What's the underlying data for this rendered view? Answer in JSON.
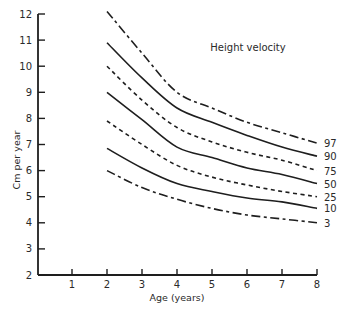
{
  "chart_data": {
    "type": "line",
    "title": "Height velocity",
    "xlabel": "Age (years)",
    "ylabel": "Cm per year",
    "xlim": [
      0,
      8
    ],
    "ylim": [
      2,
      12
    ],
    "x_ticks": [
      1,
      2,
      3,
      4,
      5,
      6,
      7,
      8
    ],
    "y_ticks": [
      2,
      3,
      4,
      5,
      6,
      7,
      8,
      9,
      10,
      11,
      12
    ],
    "grid": false,
    "legend_position": "inline-right",
    "x": [
      2,
      3,
      4,
      5,
      6,
      7,
      8
    ],
    "series": [
      {
        "name": "97",
        "style": "dash-dot",
        "values": [
          12.1,
          10.5,
          9.0,
          8.4,
          7.85,
          7.45,
          7.05
        ]
      },
      {
        "name": "90",
        "style": "solid",
        "values": [
          10.9,
          9.55,
          8.4,
          7.85,
          7.35,
          6.9,
          6.55
        ]
      },
      {
        "name": "75",
        "style": "dashed",
        "values": [
          10.0,
          8.7,
          7.65,
          7.1,
          6.7,
          6.4,
          6.0
        ]
      },
      {
        "name": "50",
        "style": "solid",
        "values": [
          9.0,
          7.95,
          6.9,
          6.5,
          6.1,
          5.85,
          5.5
        ]
      },
      {
        "name": "25",
        "style": "dashed",
        "values": [
          7.9,
          7.0,
          6.2,
          5.75,
          5.45,
          5.2,
          5.0
        ]
      },
      {
        "name": "10",
        "style": "solid",
        "values": [
          6.85,
          6.1,
          5.5,
          5.2,
          4.95,
          4.8,
          4.55
        ]
      },
      {
        "name": "3",
        "style": "dash-dot",
        "values": [
          6.0,
          5.35,
          4.9,
          4.55,
          4.3,
          4.15,
          4.0
        ]
      }
    ]
  }
}
